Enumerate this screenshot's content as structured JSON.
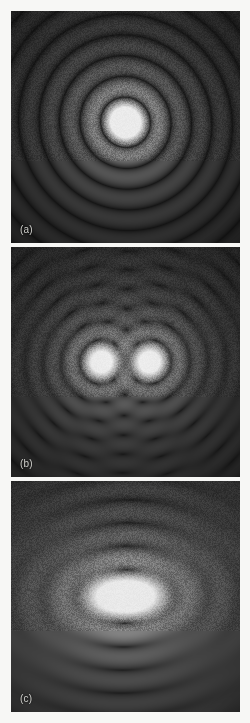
{
  "figure": {
    "background_color": "#f7f7f5",
    "panel_background": "#0d0d0d",
    "label_color": "#cfcfcb",
    "panel_count": 3
  },
  "panels": [
    {
      "label": "(a)",
      "caption_letter": "a",
      "description": "Single circular Airy diffraction pattern with concentric bright and dark rings",
      "pattern_type": "airy-single"
    },
    {
      "label": "(b)",
      "caption_letter": "b",
      "description": "Two well-resolved point sources showing two separate bright disks with overlapping fringes",
      "pattern_type": "airy-double-resolved"
    },
    {
      "label": "(c)",
      "caption_letter": "c",
      "description": "Two unresolved point sources merged into a single elongated bright core",
      "pattern_type": "airy-double-unresolved"
    }
  ],
  "chart_data": {
    "type": "heatmap",
    "title": "",
    "xlabel": "",
    "ylabel": "",
    "grid": false,
    "legend": "none",
    "colormap": "grayscale",
    "value_range": [
      0,
      255
    ],
    "panels": [
      {
        "label": "(a)",
        "pattern_type": "airy-single",
        "source_count": 1,
        "sources": [
          {
            "cx": 0.5,
            "cy": 0.48
          }
        ],
        "center_px": [
          126,
          122
        ],
        "core_radius_px": 25,
        "ring_spacing_px": 22,
        "ring_count": 5,
        "ring_radii_px": [
          25,
          47,
          69,
          91,
          113
        ],
        "fringe_contrast": 0.92,
        "ellipticity": 1.0,
        "background_level": 14,
        "peak_level": 236
      },
      {
        "label": "(b)",
        "pattern_type": "airy-double-resolved",
        "source_count": 2,
        "sources": [
          {
            "cx": 0.395,
            "cy": 0.5
          },
          {
            "cx": 0.605,
            "cy": 0.5
          }
        ],
        "separation_px": 48,
        "core_radius_px": 22,
        "ring_spacing_px": 15,
        "ring_count": 8,
        "fringe_contrast": 0.88,
        "resolved": true,
        "background_level": 16,
        "peak_level": 238
      },
      {
        "label": "(c)",
        "pattern_type": "airy-double-unresolved",
        "source_count": 2,
        "sources": [
          {
            "cx": 0.455,
            "cy": 0.5
          },
          {
            "cx": 0.545,
            "cy": 0.5
          }
        ],
        "separation_px": 21,
        "core_radius_px": 28,
        "ring_spacing_px": 20,
        "ring_count": 5,
        "fringe_contrast": 0.8,
        "resolved": false,
        "ellipticity": 1.35,
        "background_level": 18,
        "peak_level": 234
      }
    ]
  }
}
